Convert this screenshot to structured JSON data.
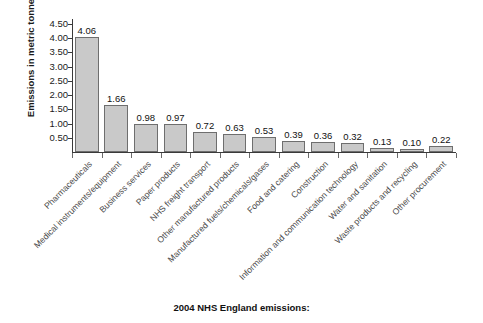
{
  "caption": "2004 NHS England emissions:",
  "axes": {
    "ylabel_main": "Emissions in metric tonnes",
    "ylabel_sub_base": "CO",
    "ylabel_sub_script": "2",
    "y_ticks": [
      "4.50",
      "4.00",
      "3.50",
      "3.00",
      "2.50",
      "2.00",
      "1.50",
      "1.00",
      "0.50"
    ]
  },
  "chart_data": {
    "type": "bar",
    "title": "2004 NHS England emissions:",
    "xlabel": "",
    "ylabel": "Emissions in metric tonnes CO2",
    "ylim": [
      0,
      4.5
    ],
    "grid": false,
    "legend": "none",
    "categories": [
      "Pharmaceuticals",
      "Medical instruments/equipment",
      "Business services",
      "Paper products",
      "NHS freight transport",
      "Other manufactured products",
      "Manufactured fuels/chemicals/gases",
      "Food and catering",
      "Construction",
      "Information and communication technology",
      "Water and sanitation",
      "Waste products and recycling",
      "Other procurement"
    ],
    "values": [
      4.06,
      1.66,
      0.98,
      0.97,
      0.72,
      0.63,
      0.53,
      0.39,
      0.36,
      0.32,
      0.13,
      0.1,
      0.22
    ],
    "value_labels": [
      "4.06",
      "1.66",
      "0.98",
      "0.97",
      "0.72",
      "0.63",
      "0.53",
      "0.39",
      "0.36",
      "0.32",
      "0.13",
      "0.10",
      "0.22"
    ],
    "bar_color": "#c9c9c9",
    "bar_edge_color": "#6e6e6e"
  }
}
